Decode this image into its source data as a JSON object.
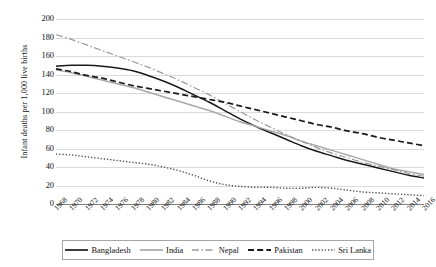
{
  "chart_data": {
    "type": "line",
    "title": "",
    "xlabel": "",
    "ylabel": "Infant deaths per 1,000 live births",
    "ylim": [
      0,
      200
    ],
    "ytick_values": [
      0,
      20,
      40,
      60,
      80,
      100,
      120,
      140,
      160,
      180,
      200
    ],
    "grid": true,
    "legend_position": "bottom",
    "xlim": [
      1968,
      2016
    ],
    "x": [
      1968,
      1970,
      1972,
      1974,
      1976,
      1978,
      1980,
      1982,
      1984,
      1986,
      1988,
      1990,
      1992,
      1994,
      1996,
      1998,
      2000,
      2002,
      2004,
      2006,
      2008,
      2010,
      2012,
      2014,
      2016
    ],
    "xtick_labels": [
      "1968",
      "1970",
      "1972",
      "1974",
      "1976",
      "1978",
      "1980",
      "1982",
      "1984",
      "1986",
      "1988",
      "1990",
      "1992",
      "1994",
      "1996",
      "1998",
      "2000",
      "2002",
      "2004",
      "2006",
      "2008",
      "2010",
      "2012",
      "2014",
      "2016"
    ],
    "series": [
      {
        "name": "Bangladesh",
        "color": "#1a1a1a",
        "style": "solid",
        "values": [
          149,
          150,
          150,
          149,
          147,
          144,
          139,
          133,
          126,
          118,
          110,
          101,
          92,
          84,
          77,
          70,
          63,
          57,
          52,
          47,
          43,
          39,
          35,
          31,
          28
        ]
      },
      {
        "name": "India",
        "color": "#a8a8a8",
        "style": "solid",
        "values": [
          145,
          142,
          138,
          134,
          130,
          126,
          121,
          116,
          111,
          106,
          101,
          95,
          89,
          84,
          79,
          74,
          68,
          63,
          58,
          53,
          48,
          43,
          38,
          35,
          32
        ]
      },
      {
        "name": "Nepal",
        "color": "#9a9a9a",
        "style": "dashdot",
        "values": [
          183,
          178,
          172,
          166,
          160,
          154,
          148,
          141,
          134,
          126,
          118,
          109,
          100,
          91,
          83,
          75,
          68,
          61,
          55,
          50,
          45,
          41,
          37,
          33,
          30
        ]
      },
      {
        "name": "Pakistan",
        "color": "#1a1a1a",
        "style": "dashed",
        "values": [
          146,
          143,
          139,
          136,
          132,
          128,
          125,
          122,
          119,
          116,
          113,
          110,
          106,
          102,
          98,
          94,
          90,
          86,
          83,
          79,
          76,
          72,
          69,
          66,
          63
        ]
      },
      {
        "name": "Sri Lanka",
        "color": "#4d4d4d",
        "style": "dotted",
        "values": [
          54,
          53,
          51,
          49,
          47,
          45,
          43,
          40,
          36,
          31,
          25,
          21,
          19,
          18,
          18,
          17,
          17,
          18,
          17,
          15,
          13,
          12,
          11,
          10,
          9
        ]
      }
    ]
  },
  "legend": {
    "items": [
      {
        "label": "Bangladesh"
      },
      {
        "label": "India"
      },
      {
        "label": "Nepal"
      },
      {
        "label": "Pakistan"
      },
      {
        "label": "Sri Lanka"
      }
    ]
  }
}
